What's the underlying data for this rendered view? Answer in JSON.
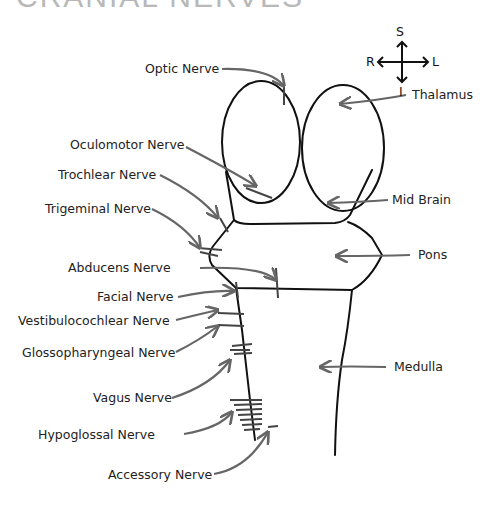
{
  "title": "CRANIAL NERVES",
  "compass": {
    "superior": "S",
    "inferior": "I",
    "right": "R",
    "left": "L"
  },
  "structures": [
    {
      "label": "Thalamus"
    },
    {
      "label": "Mid Brain"
    },
    {
      "label": "Pons"
    },
    {
      "label": "Medulla"
    }
  ],
  "nerves": [
    {
      "label": "Optic Nerve"
    },
    {
      "label": "Oculomotor Nerve"
    },
    {
      "label": "Trochlear Nerve"
    },
    {
      "label": "Trigeminal Nerve"
    },
    {
      "label": "Abducens Nerve"
    },
    {
      "label": "Facial Nerve"
    },
    {
      "label": "Vestibulocochlear Nerve"
    },
    {
      "label": "Glossopharyngeal Nerve"
    },
    {
      "label": "Vagus Nerve"
    },
    {
      "label": "Hypoglossal Nerve"
    },
    {
      "label": "Accessory Nerve"
    }
  ],
  "colors": {
    "outline": "#111111",
    "arrow": "#666666",
    "text": "#222222"
  }
}
